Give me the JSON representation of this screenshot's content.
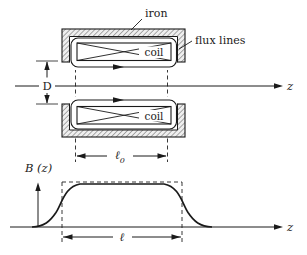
{
  "figure": {
    "labels": {
      "iron": "iron",
      "flux_lines": "flux lines",
      "coil_top": "coil",
      "coil_bottom": "coil",
      "gap_diameter": "D",
      "axis_z": "z",
      "coil_length_symbol": "ℓ",
      "coil_length_subscript": "0"
    },
    "plot": {
      "y_axis": "B (z)",
      "x_axis": "z",
      "effective_length": "ℓ"
    },
    "colors": {
      "ink": "#1a1a1a",
      "background": "#ffffff",
      "iron_hatch_bg": "#efefef"
    }
  }
}
